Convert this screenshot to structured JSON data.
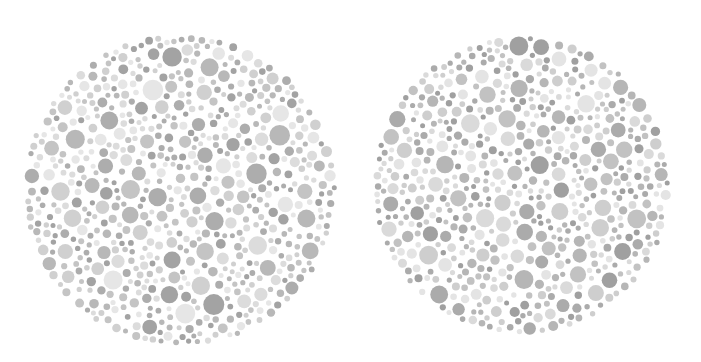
{
  "background": "#ffffff",
  "plates": [
    {
      "name": "left-plate",
      "cx": 180,
      "cy": 190,
      "r": 157,
      "seed": 1337,
      "palette": [
        "#a3a3a3",
        "#adadad",
        "#b8b8b8",
        "#c4c4c4",
        "#d0d0d0",
        "#dcdcdc",
        "#e6e6e6"
      ],
      "dot_radius_range": [
        2.5,
        10.5
      ],
      "dot_count": 900
    },
    {
      "name": "right-plate",
      "cx": 522,
      "cy": 185,
      "r": 150,
      "seed": 4242,
      "palette": [
        "#a0a0a0",
        "#ababab",
        "#b6b6b6",
        "#c2c2c2",
        "#cecece",
        "#dadada",
        "#e4e4e4"
      ],
      "dot_radius_range": [
        2.5,
        9.5
      ],
      "dot_count": 950
    }
  ]
}
